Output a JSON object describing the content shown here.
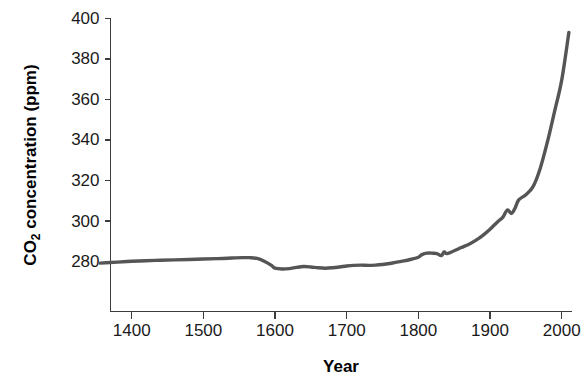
{
  "chart_data": {
    "type": "line",
    "title": "",
    "xlabel": "Year",
    "ylabel": "CO2 concentration (ppm)",
    "ylabel_main": "CO",
    "ylabel_sub": "2",
    "ylabel_rest": " concentration (ppm)",
    "xlim": [
      1356,
      2019
    ],
    "ylim": [
      270,
      400
    ],
    "xticks": [
      1400,
      1500,
      1600,
      1700,
      1800,
      1900,
      2000
    ],
    "xtick_labels": [
      "1400",
      "1500",
      "1600",
      "1700",
      "1800",
      "1900",
      "2000"
    ],
    "yticks": [
      280,
      300,
      320,
      340,
      360,
      380,
      400
    ],
    "ytick_labels": [
      "280",
      "300",
      "320",
      "340",
      "360",
      "380",
      "400"
    ],
    "grid": false,
    "legend": false,
    "line_color": "#555555",
    "axis_color": "#3c3c3c",
    "background": "#ffffff",
    "series": [
      {
        "name": "Atmospheric CO2 concentration",
        "x": [
          1356,
          1380,
          1400,
          1420,
          1440,
          1460,
          1480,
          1500,
          1520,
          1540,
          1555,
          1565,
          1575,
          1585,
          1595,
          1600,
          1610,
          1620,
          1630,
          1640,
          1650,
          1660,
          1670,
          1680,
          1690,
          1700,
          1710,
          1720,
          1730,
          1740,
          1750,
          1760,
          1770,
          1780,
          1790,
          1800,
          1805,
          1812,
          1820,
          1826,
          1832,
          1836,
          1840,
          1850,
          1860,
          1870,
          1880,
          1890,
          1900,
          1910,
          1918,
          1924,
          1930,
          1935,
          1940,
          1950,
          1960,
          1970,
          1980,
          1990,
          2000,
          2010
        ],
        "y": [
          279.3,
          279.8,
          280.2,
          280.5,
          280.7,
          280.9,
          281.1,
          281.3,
          281.5,
          281.8,
          282.0,
          282.0,
          281.6,
          280.2,
          278.2,
          276.8,
          276.4,
          276.6,
          277.2,
          277.6,
          277.4,
          277.0,
          276.8,
          277.0,
          277.4,
          277.9,
          278.2,
          278.3,
          278.2,
          278.3,
          278.6,
          279.1,
          279.8,
          280.4,
          281.2,
          282.2,
          283.5,
          284.2,
          284.2,
          284.0,
          283.0,
          284.8,
          284.0,
          285.4,
          287.0,
          288.5,
          290.5,
          293.0,
          296.0,
          299.5,
          302.0,
          305.5,
          303.8,
          306.5,
          310.5,
          313.0,
          317.0,
          326.0,
          339.0,
          354.0,
          369.5,
          393.0
        ]
      }
    ],
    "annotations": []
  }
}
